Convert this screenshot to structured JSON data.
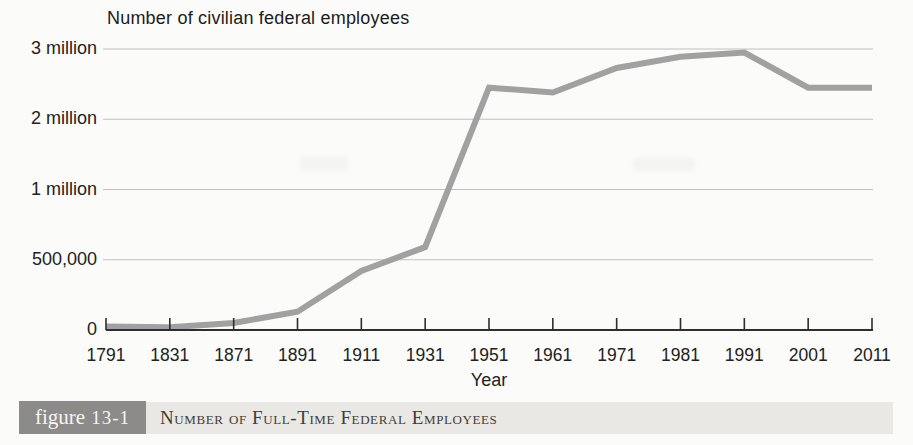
{
  "caption": {
    "figure_word": "figure",
    "figure_number": "13-1",
    "title": "Number of Full-Time Federal Employees"
  },
  "colors": {
    "line": "#a1a1a1",
    "gridline": "#c0c0c0",
    "axis": "#2e2e2e",
    "figure_box_bg": "#8c8b89",
    "caption_band_bg": "#e9e8e5"
  },
  "chart_data": {
    "type": "line",
    "title": "Number of civilian federal employees",
    "xlabel": "Year",
    "ylabel": "Number of civilian federal employees",
    "categories": [
      "1791",
      "1831",
      "1871",
      "1891",
      "1911",
      "1931",
      "1951",
      "1961",
      "1971",
      "1981",
      "1991",
      "2001",
      "2011"
    ],
    "values": [
      25000,
      20000,
      50000,
      130000,
      420000,
      590000,
      2450000,
      2380000,
      2730000,
      2890000,
      2950000,
      2450000,
      2450000
    ],
    "series_name": "Number of civilian federal employees",
    "ylim": [
      0,
      3000000
    ],
    "y_ticks": [
      0,
      500000,
      1000000,
      2000000,
      3000000
    ],
    "y_tick_labels": [
      "0",
      "500,000",
      "1 million",
      "2 million",
      "3 million"
    ],
    "y_axis_note": "tick labels equally spaced on axis despite unequal value intervals",
    "grid": "horizontal gridlines at labeled ticks",
    "legend": "none"
  }
}
